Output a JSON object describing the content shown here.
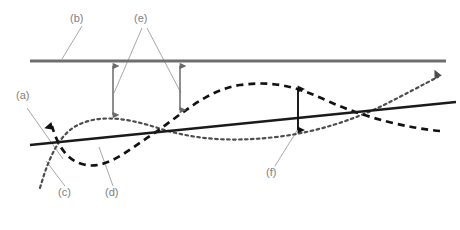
{
  "figure": {
    "type": "line-diagram",
    "background_color": "#ffffff",
    "width": 460,
    "height": 230
  },
  "colors": {
    "reference_line": "#6e6e6e",
    "solid_line": "#1a1a1a",
    "dashed_curve": "#111111",
    "dotted_curve": "#4d4d4d",
    "measure_arrow_gray": "#6a6a6a",
    "measure_arrow_black": "#111111",
    "leader_line": "#a8a8a8",
    "label_text": "#808080"
  },
  "labels": [
    {
      "id": "a",
      "text": "(a)",
      "x": 16,
      "y": 95,
      "refers_to": "solid-straight-line"
    },
    {
      "id": "b",
      "text": "(b)",
      "x": 70,
      "y": 12,
      "refers_to": "horizontal-reference-line"
    },
    {
      "id": "c",
      "text": "(c)",
      "x": 58,
      "y": 188,
      "refers_to": "dotted-curve"
    },
    {
      "id": "d",
      "text": "(d)",
      "x": 105,
      "y": 188,
      "refers_to": "dashed-curve"
    },
    {
      "id": "e",
      "text": "(e)",
      "x": 134,
      "y": 12,
      "refers_to": "vertical-gap-arrows"
    },
    {
      "id": "f",
      "text": "(f)",
      "x": 266,
      "y": 168,
      "refers_to": "curve-separation-arrow"
    }
  ],
  "leader_lines": [
    {
      "id": "b",
      "from_x": 82,
      "from_y": 26,
      "to_x": 62,
      "to_y": 60
    },
    {
      "id": "e-left",
      "from_x": 142,
      "from_y": 27,
      "to_x": 114,
      "to_y": 92
    },
    {
      "id": "e-right",
      "from_x": 146,
      "from_y": 27,
      "to_x": 181,
      "to_y": 92
    },
    {
      "id": "a",
      "from_x": 26,
      "from_y": 108,
      "to_x": 62,
      "to_y": 158
    },
    {
      "id": "c",
      "from_x": 64,
      "from_y": 186,
      "to_x": 46,
      "to_y": 162
    },
    {
      "id": "d",
      "from_x": 112,
      "from_y": 186,
      "to_x": 98,
      "to_y": 148
    },
    {
      "id": "f",
      "from_x": 274,
      "from_y": 166,
      "to_x": 298,
      "to_y": 130
    }
  ],
  "elements": {
    "reference_line": {
      "name": "horizontal reference line",
      "x1": 30,
      "y1": 61,
      "x2": 446,
      "y2": 61,
      "style": "solid",
      "stroke_width": 3
    },
    "solid_line": {
      "name": "solid straight trend line",
      "x1": 30,
      "y1": 145,
      "x2": 456,
      "y2": 102,
      "style": "solid",
      "stroke_width": 2.2
    },
    "dashed_curve": {
      "name": "dashed sigmoid curve",
      "style": "dashed",
      "stroke_width": 2.6,
      "path": "M 50,122 C 56,140 62,158 82,164 C 104,171 126,152 150,136 C 180,116 206,90 240,85 C 276,80 300,88 330,102 C 366,118 408,128 440,131",
      "has_arrowhead_start": true,
      "arrowhead_at": {
        "x": 50,
        "y": 122,
        "direction": "up-left"
      }
    },
    "dotted_curve": {
      "name": "dotted rising curve",
      "style": "dotted",
      "stroke_width": 2.2,
      "path": "M 40,188 C 48,160 58,136 76,126 C 100,113 130,119 158,128 C 196,140 232,142 276,137 C 318,132 352,120 382,106 C 404,95 424,84 440,76",
      "has_arrowhead_end": true,
      "arrowhead_at": {
        "x": 442,
        "y": 74,
        "direction": "up-right"
      }
    },
    "gap_arrows": [
      {
        "name": "left gap arrow",
        "x": 113,
        "y_top": 62,
        "y_bottom": 119,
        "double_headed": true,
        "color_key": "measure_arrow_gray"
      },
      {
        "name": "right gap arrow",
        "x": 180,
        "y_top": 62,
        "y_bottom": 114,
        "double_headed": true,
        "color_key": "measure_arrow_gray"
      }
    ],
    "separation_arrow": {
      "name": "curve separation arrow",
      "x": 298,
      "y_top": 85,
      "y_bottom": 134,
      "double_headed": true,
      "color_key": "measure_arrow_black"
    }
  }
}
